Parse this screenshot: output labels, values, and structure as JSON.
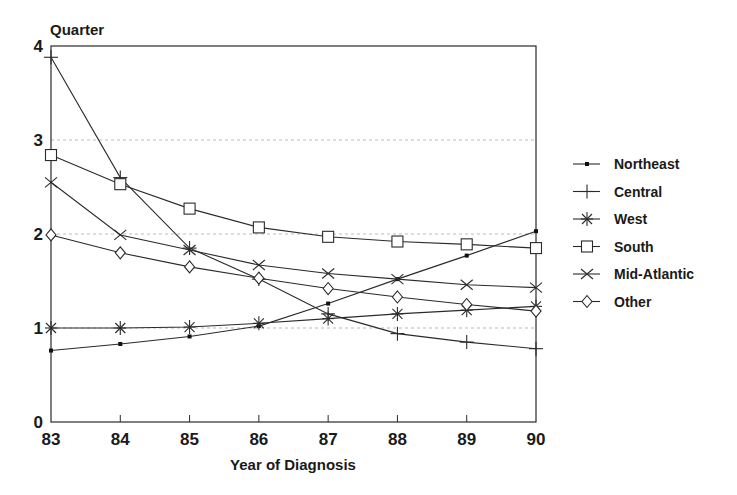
{
  "chart_data": {
    "type": "line",
    "title": "",
    "ylabel": "Quarter",
    "xlabel": "Year of Diagnosis",
    "x": [
      "83",
      "84",
      "85",
      "86",
      "87",
      "88",
      "89",
      "90"
    ],
    "ylim": [
      0,
      4
    ],
    "yticks": [
      "0",
      "1",
      "2",
      "3",
      "4"
    ],
    "grid": "horizontal dashed at 1, 2, 3",
    "legend_position": "right",
    "series": [
      {
        "name": "Northeast",
        "marker": "dot",
        "values": [
          0.76,
          0.83,
          0.91,
          1.02,
          1.26,
          1.52,
          1.77,
          2.03
        ]
      },
      {
        "name": "Central",
        "marker": "plus",
        "values": [
          3.88,
          2.6,
          1.85,
          1.52,
          1.15,
          0.94,
          0.85,
          0.78
        ]
      },
      {
        "name": "West",
        "marker": "asterisk",
        "values": [
          1.0,
          1.0,
          1.01,
          1.05,
          1.1,
          1.15,
          1.19,
          1.23
        ]
      },
      {
        "name": "South",
        "marker": "square",
        "values": [
          2.84,
          2.53,
          2.27,
          2.07,
          1.97,
          1.92,
          1.89,
          1.85
        ]
      },
      {
        "name": "Mid-Atlantic",
        "marker": "x",
        "values": [
          2.55,
          1.99,
          1.83,
          1.67,
          1.58,
          1.52,
          1.46,
          1.43
        ]
      },
      {
        "name": "Other",
        "marker": "diamond",
        "values": [
          1.99,
          1.8,
          1.65,
          1.53,
          1.42,
          1.33,
          1.25,
          1.18
        ]
      }
    ]
  }
}
